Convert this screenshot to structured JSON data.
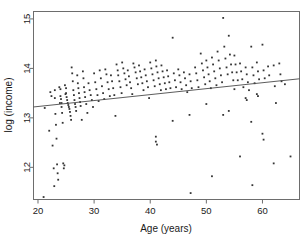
{
  "chart_data": {
    "type": "scatter",
    "title": "",
    "xlabel": "Age (years)",
    "ylabel": "log (income)",
    "xlim": [
      19.2,
      66.6
    ],
    "ylim": [
      11.35,
      15.15
    ],
    "xticks": [
      20,
      30,
      40,
      50,
      60
    ],
    "yticks": [
      12,
      13,
      14,
      15
    ],
    "xtick_labels": [
      "20",
      "30",
      "40",
      "50",
      "60"
    ],
    "ytick_labels": [
      "12",
      "13",
      "14",
      "15"
    ],
    "grid": false,
    "legend": "none",
    "marker": "small-filled-square",
    "marker_color": "#343434",
    "frame_color": "#6d6d6d",
    "series": [
      {
        "name": "observations",
        "n_points": 232,
        "points": [
          [
            21.0,
            11.4
          ],
          [
            21.2,
            13.2
          ],
          [
            22.0,
            12.74
          ],
          [
            22.2,
            13.52
          ],
          [
            22.4,
            13.44
          ],
          [
            22.6,
            12.44
          ],
          [
            22.8,
            11.98
          ],
          [
            22.9,
            11.62
          ],
          [
            23.0,
            13.56
          ],
          [
            23.0,
            13.4
          ],
          [
            23.1,
            13.08
          ],
          [
            23.2,
            12.86
          ],
          [
            23.3,
            12.58
          ],
          [
            23.4,
            12.06
          ],
          [
            23.5,
            11.88
          ],
          [
            23.6,
            11.75
          ],
          [
            23.8,
            13.62
          ],
          [
            23.9,
            13.3
          ],
          [
            24.0,
            13.58
          ],
          [
            24.0,
            13.44
          ],
          [
            24.1,
            13.38
          ],
          [
            24.2,
            13.3
          ],
          [
            24.2,
            13.22
          ],
          [
            24.3,
            13.1
          ],
          [
            24.4,
            12.9
          ],
          [
            24.5,
            12.08
          ],
          [
            24.6,
            11.98
          ],
          [
            24.7,
            12.04
          ],
          [
            24.8,
            13.66
          ],
          [
            24.9,
            13.48
          ],
          [
            25.0,
            13.6
          ],
          [
            25.0,
            13.5
          ],
          [
            25.1,
            13.42
          ],
          [
            25.2,
            13.36
          ],
          [
            25.3,
            13.3
          ],
          [
            25.4,
            13.26
          ],
          [
            25.5,
            13.22
          ],
          [
            25.6,
            13.18
          ],
          [
            25.7,
            13.12
          ],
          [
            25.8,
            13.04
          ],
          [
            25.9,
            12.96
          ],
          [
            26.0,
            14.02
          ],
          [
            26.1,
            13.9
          ],
          [
            26.2,
            13.74
          ],
          [
            26.3,
            13.56
          ],
          [
            26.4,
            13.46
          ],
          [
            26.5,
            13.36
          ],
          [
            26.6,
            13.28
          ],
          [
            26.7,
            13.22
          ],
          [
            26.8,
            13.14
          ],
          [
            27.0,
            13.86
          ],
          [
            27.1,
            13.7
          ],
          [
            27.2,
            13.6
          ],
          [
            27.3,
            13.5
          ],
          [
            27.4,
            13.4
          ],
          [
            27.5,
            13.32
          ],
          [
            27.6,
            13.24
          ],
          [
            27.8,
            12.96
          ],
          [
            28.0,
            13.94
          ],
          [
            28.1,
            13.8
          ],
          [
            28.2,
            13.62
          ],
          [
            28.3,
            13.52
          ],
          [
            28.4,
            13.42
          ],
          [
            28.6,
            13.28
          ],
          [
            28.8,
            13.1
          ],
          [
            29.0,
            13.7
          ],
          [
            29.2,
            13.56
          ],
          [
            29.4,
            13.46
          ],
          [
            29.6,
            13.36
          ],
          [
            29.8,
            13.22
          ],
          [
            30.0,
            13.9
          ],
          [
            30.2,
            13.72
          ],
          [
            30.4,
            13.58
          ],
          [
            30.6,
            13.46
          ],
          [
            30.8,
            13.34
          ],
          [
            31.0,
            13.96
          ],
          [
            31.2,
            13.8
          ],
          [
            31.4,
            13.64
          ],
          [
            31.6,
            13.5
          ],
          [
            31.8,
            13.38
          ],
          [
            32.0,
            13.98
          ],
          [
            32.2,
            13.88
          ],
          [
            32.4,
            13.72
          ],
          [
            32.6,
            13.58
          ],
          [
            32.8,
            13.44
          ],
          [
            33.0,
            13.86
          ],
          [
            33.2,
            13.74
          ],
          [
            33.4,
            13.6
          ],
          [
            33.6,
            13.46
          ],
          [
            33.8,
            13.04
          ],
          [
            34.0,
            14.08
          ],
          [
            34.2,
            13.96
          ],
          [
            34.3,
            13.86
          ],
          [
            34.5,
            13.74
          ],
          [
            34.7,
            13.62
          ],
          [
            34.9,
            13.5
          ],
          [
            35.0,
            14.12
          ],
          [
            35.2,
            14.0
          ],
          [
            35.4,
            13.9
          ],
          [
            35.6,
            13.78
          ],
          [
            35.8,
            13.66
          ],
          [
            36.0,
            13.96
          ],
          [
            36.2,
            13.84
          ],
          [
            36.4,
            13.72
          ],
          [
            36.6,
            13.6
          ],
          [
            36.8,
            13.48
          ],
          [
            37.0,
            14.1
          ],
          [
            37.2,
            14.02
          ],
          [
            37.4,
            13.92
          ],
          [
            37.6,
            13.8
          ],
          [
            37.8,
            13.68
          ],
          [
            38.0,
            14.06
          ],
          [
            38.2,
            13.94
          ],
          [
            38.4,
            13.82
          ],
          [
            38.6,
            13.7
          ],
          [
            38.8,
            13.56
          ],
          [
            39.0,
            13.98
          ],
          [
            39.2,
            13.86
          ],
          [
            39.4,
            13.74
          ],
          [
            39.6,
            13.62
          ],
          [
            39.8,
            13.4
          ],
          [
            40.0,
            14.12
          ],
          [
            40.2,
            14.0
          ],
          [
            40.4,
            13.88
          ],
          [
            40.6,
            13.76
          ],
          [
            40.8,
            13.64
          ],
          [
            41.0,
            14.16
          ],
          [
            41.1,
            14.04
          ],
          [
            41.3,
            13.92
          ],
          [
            41.5,
            13.8
          ],
          [
            41.7,
            13.68
          ],
          [
            41.9,
            13.56
          ],
          [
            41.0,
            12.62
          ],
          [
            41.0,
            12.52
          ],
          [
            41.2,
            12.46
          ],
          [
            42.0,
            14.06
          ],
          [
            42.2,
            13.94
          ],
          [
            42.4,
            13.82
          ],
          [
            42.6,
            13.7
          ],
          [
            42.8,
            13.58
          ],
          [
            43.0,
            13.96
          ],
          [
            43.2,
            13.84
          ],
          [
            43.4,
            13.72
          ],
          [
            43.6,
            13.6
          ],
          [
            44.0,
            14.62
          ],
          [
            44.2,
            13.9
          ],
          [
            44.4,
            13.76
          ],
          [
            44.6,
            13.62
          ],
          [
            44.0,
            12.94
          ],
          [
            45.0,
            13.98
          ],
          [
            45.2,
            13.86
          ],
          [
            45.4,
            13.72
          ],
          [
            45.6,
            13.58
          ],
          [
            46.0,
            13.92
          ],
          [
            46.2,
            13.8
          ],
          [
            46.4,
            13.66
          ],
          [
            46.6,
            13.52
          ],
          [
            47.0,
            13.88
          ],
          [
            47.2,
            13.74
          ],
          [
            47.4,
            13.6
          ],
          [
            47.0,
            13.06
          ],
          [
            47.2,
            11.48
          ],
          [
            48.0,
            14.02
          ],
          [
            48.2,
            13.9
          ],
          [
            48.4,
            13.76
          ],
          [
            48.6,
            13.62
          ],
          [
            49.0,
            14.3
          ],
          [
            49.2,
            14.1
          ],
          [
            49.4,
            13.96
          ],
          [
            49.6,
            13.82
          ],
          [
            49.8,
            13.68
          ],
          [
            50.0,
            14.16
          ],
          [
            50.2,
            14.02
          ],
          [
            50.4,
            13.88
          ],
          [
            50.6,
            13.74
          ],
          [
            50.8,
            13.6
          ],
          [
            50.0,
            13.28
          ],
          [
            51.0,
            14.22
          ],
          [
            51.2,
            14.08
          ],
          [
            51.4,
            13.94
          ],
          [
            51.6,
            13.8
          ],
          [
            51.8,
            13.66
          ],
          [
            51.0,
            11.82
          ],
          [
            52.0,
            14.34
          ],
          [
            52.2,
            14.16
          ],
          [
            52.4,
            14.0
          ],
          [
            52.6,
            13.86
          ],
          [
            52.8,
            13.72
          ],
          [
            53.0,
            15.02
          ],
          [
            53.2,
            14.44
          ],
          [
            53.4,
            14.2
          ],
          [
            53.6,
            14.02
          ],
          [
            53.8,
            13.88
          ],
          [
            53.0,
            13.06
          ],
          [
            54.0,
            14.66
          ],
          [
            54.2,
            14.28
          ],
          [
            54.4,
            14.08
          ],
          [
            54.6,
            13.92
          ],
          [
            54.8,
            13.76
          ],
          [
            54.0,
            13.14
          ],
          [
            55.0,
            14.26
          ],
          [
            55.2,
            14.08
          ],
          [
            55.4,
            13.92
          ],
          [
            55.6,
            13.76
          ],
          [
            55.0,
            13.58
          ],
          [
            56.0,
            14.1
          ],
          [
            56.2,
            13.94
          ],
          [
            56.4,
            13.78
          ],
          [
            56.6,
            13.62
          ],
          [
            56.0,
            12.22
          ],
          [
            57.0,
            14.02
          ],
          [
            57.2,
            13.88
          ],
          [
            57.4,
            13.72
          ],
          [
            57.6,
            13.56
          ],
          [
            57.0,
            13.4
          ],
          [
            57.2,
            13.36
          ],
          [
            58.0,
            14.44
          ],
          [
            58.2,
            14.02
          ],
          [
            58.4,
            13.86
          ],
          [
            58.6,
            13.7
          ],
          [
            58.0,
            12.92
          ],
          [
            58.2,
            11.64
          ],
          [
            59.0,
            14.12
          ],
          [
            59.2,
            13.94
          ],
          [
            59.4,
            13.78
          ],
          [
            59.0,
            13.48
          ],
          [
            59.2,
            13.44
          ],
          [
            60.0,
            14.48
          ],
          [
            60.2,
            13.96
          ],
          [
            60.4,
            13.8
          ],
          [
            60.0,
            12.68
          ],
          [
            60.2,
            12.56
          ],
          [
            61.0,
            14.04
          ],
          [
            61.2,
            13.86
          ],
          [
            62.0,
            14.06
          ],
          [
            62.2,
            13.64
          ],
          [
            62.4,
            13.3
          ],
          [
            62.0,
            12.08
          ],
          [
            63.0,
            14.1
          ],
          [
            63.2,
            13.88
          ],
          [
            63.4,
            13.74
          ],
          [
            64.0,
            13.68
          ],
          [
            65.0,
            12.22
          ]
        ]
      }
    ],
    "fit_line": {
      "name": "regression-line",
      "x_start": 19.2,
      "y_start": 13.22,
      "x_end": 66.6,
      "y_end": 13.79
    }
  }
}
